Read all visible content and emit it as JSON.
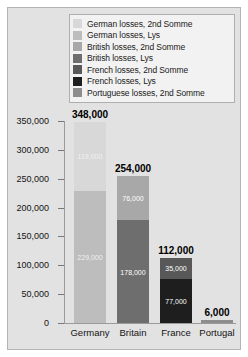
{
  "chart_data": {
    "type": "bar",
    "subtype": "stacked",
    "title": "",
    "xlabel": "",
    "ylabel": "",
    "categories": [
      "Germany",
      "Britain",
      "France",
      "Portugal"
    ],
    "ylim": [
      0,
      350000
    ],
    "yticks": [
      0,
      50000,
      100000,
      150000,
      200000,
      250000,
      300000,
      350000
    ],
    "ytick_labels": [
      "0",
      "50,000",
      "100,000",
      "150,000",
      "200,000",
      "250,000",
      "300,000",
      "350,000"
    ],
    "grid": false,
    "legend_position": "top",
    "series": [
      {
        "name": "German losses, 2nd Somme",
        "color": "#d8d8d8",
        "values": [
          119000,
          0,
          0,
          0
        ]
      },
      {
        "name": "German losses, Lys",
        "color": "#bdbdbd",
        "values": [
          229000,
          0,
          0,
          0
        ]
      },
      {
        "name": "British losses, 2nd Somme",
        "color": "#a8a8a8",
        "values": [
          0,
          76000,
          0,
          0
        ]
      },
      {
        "name": "British losses, Lys",
        "color": "#6e6e6e",
        "values": [
          0,
          178000,
          0,
          0
        ]
      },
      {
        "name": "French losses, 2nd Somme",
        "color": "#585858",
        "values": [
          0,
          0,
          35000,
          0
        ]
      },
      {
        "name": "French losses, Lys",
        "color": "#1e1e1e",
        "values": [
          0,
          0,
          77000,
          0
        ]
      },
      {
        "name": "Portuguese losses, 2nd Somme",
        "color": "#8d8d8d",
        "values": [
          0,
          0,
          0,
          6000
        ]
      }
    ],
    "totals": [
      348000,
      254000,
      112000,
      6000
    ],
    "total_labels": [
      "348,000",
      "254,000",
      "112,000",
      "6,000"
    ]
  },
  "legend": {
    "items": [
      {
        "label": "German losses, 2nd Somme",
        "color": "#d8d8d8"
      },
      {
        "label": "German losses, Lys",
        "color": "#bdbdbd"
      },
      {
        "label": "British losses, 2nd Somme",
        "color": "#a8a8a8"
      },
      {
        "label": "British losses, Lys",
        "color": "#6e6e6e"
      },
      {
        "label": "French losses, 2nd Somme",
        "color": "#585858"
      },
      {
        "label": "French losses, Lys",
        "color": "#1e1e1e"
      },
      {
        "label": "Portuguese losses, 2nd Somme",
        "color": "#8d8d8d"
      }
    ]
  },
  "bars": [
    {
      "category": "Germany",
      "total_label": "348,000",
      "segments": [
        {
          "label": "119,000",
          "value": 119000,
          "color": "#d8d8d8",
          "label_style": "dim"
        },
        {
          "label": "229,000",
          "value": 229000,
          "color": "#bdbdbd",
          "label_style": "dim"
        }
      ]
    },
    {
      "category": "Britain",
      "total_label": "254,000",
      "segments": [
        {
          "label": "76,000",
          "value": 76000,
          "color": "#a8a8a8",
          "label_style": "normal"
        },
        {
          "label": "178,000",
          "value": 178000,
          "color": "#6e6e6e",
          "label_style": "normal"
        }
      ]
    },
    {
      "category": "France",
      "total_label": "112,000",
      "segments": [
        {
          "label": "35,000",
          "value": 35000,
          "color": "#585858",
          "label_style": "normal"
        },
        {
          "label": "77,000",
          "value": 77000,
          "color": "#1e1e1e",
          "label_style": "normal"
        }
      ]
    },
    {
      "category": "Portugal",
      "total_label": "6,000",
      "segments": [
        {
          "label": "",
          "value": 6000,
          "color": "#8d8d8d",
          "label_style": "normal"
        }
      ]
    }
  ]
}
